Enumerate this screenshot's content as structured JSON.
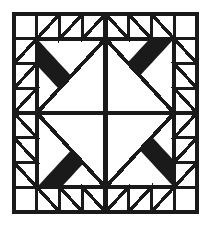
{
  "figure": {
    "type": "line-drawing",
    "caption": "",
    "background_color": "#ffffff",
    "ink_color": "#1a1a1a"
  },
  "canvas": {
    "width": 208,
    "height": 227
  },
  "block": {
    "name": "pinwheel-sawtooth-quilt-block",
    "x": 14,
    "y": 14,
    "width": 183,
    "height": 198,
    "outer_border_color": "#1a1a1a",
    "outer_border_width": 1.6,
    "symmetry": "4-fold rotational",
    "quadrant_grid": "2x2",
    "cells_per_quadrant": "4x4"
  },
  "quadrants": [
    {
      "name": "top-left-quadrant",
      "rotation_degrees": 0,
      "corner_square": "plain-white",
      "large_triangle_fill": "cross-hatch",
      "small_triangle_fill": "diagonal-hatch",
      "small_triangle_count": 6
    },
    {
      "name": "top-right-quadrant",
      "rotation_degrees": 90,
      "corner_square": "plain-white",
      "large_triangle_fill": "cross-hatch",
      "small_triangle_fill": "diagonal-hatch",
      "small_triangle_count": 6
    },
    {
      "name": "bottom-right-quadrant",
      "rotation_degrees": 180,
      "corner_square": "plain-white",
      "large_triangle_fill": "cross-hatch",
      "small_triangle_fill": "diagonal-hatch",
      "small_triangle_count": 6
    },
    {
      "name": "bottom-left-quadrant",
      "rotation_degrees": 270,
      "corner_square": "plain-white",
      "large_triangle_fill": "cross-hatch",
      "small_triangle_fill": "diagonal-hatch",
      "small_triangle_count": 6
    }
  ],
  "legend": {
    "fills": [
      {
        "key": "cross-hatch",
        "label": "cross-hatch",
        "description": "diamond grid fill"
      },
      {
        "key": "diagonal-hatch",
        "label": "diagonal-hatch",
        "description": "parallel diagonal lines"
      },
      {
        "key": "plain-white",
        "label": "plain",
        "description": "unfilled white patch"
      }
    ]
  }
}
